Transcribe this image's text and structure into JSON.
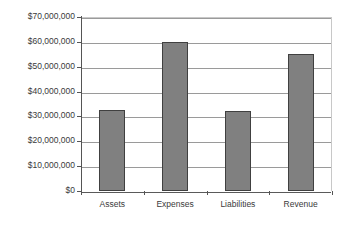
{
  "chart_data": {
    "type": "bar",
    "title": "",
    "subtitle": "",
    "xlabel": "",
    "ylabel": "",
    "categories": [
      "Assets",
      "Expenses",
      "Liabilities",
      "Revenue"
    ],
    "values": [
      32500000,
      60000000,
      32300000,
      55000000
    ],
    "ylim": [
      0,
      70000000
    ],
    "ytick_values": [
      0,
      10000000,
      20000000,
      30000000,
      40000000,
      50000000,
      60000000,
      70000000
    ],
    "ytick_labels": [
      "$0",
      "$10,000,000",
      "$20,000,000",
      "$30,000,000",
      "$40,000,000",
      "$50,000,000",
      "$60,000,000",
      "$70,000,000"
    ],
    "grid": "horizontal",
    "legend": "none",
    "series": [
      {
        "name": "",
        "values": [
          32500000,
          60000000,
          32300000,
          55000000
        ]
      }
    ],
    "colors": {
      "bar_fill": "#808080",
      "bar_border": "#404040",
      "gridline": "#9a9a9a",
      "axis_line": "#555555",
      "plot_border": "#c8c8c8",
      "background": "#ffffff",
      "text": "#3a3a3a"
    }
  }
}
